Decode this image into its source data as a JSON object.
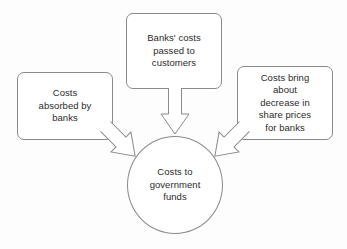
{
  "diagram": {
    "background_color": "#fdfdfd",
    "line_color": "#8a8a8a",
    "text_color": "#2b2b2b",
    "nodes": [
      {
        "id": "banks-costs-passed-to-customers",
        "shape": "rounded-rectangle",
        "text": "Banks' costs\npassed to\ncustomers"
      },
      {
        "id": "costs-absorbed-by-banks",
        "shape": "rounded-rectangle",
        "text": "Costs\nabsorbed by\nbanks"
      },
      {
        "id": "costs-bring-about-decrease",
        "shape": "rounded-rectangle",
        "text": "Costs bring\nabout\ndecrease in\nshare prices\nfor banks"
      },
      {
        "id": "costs-to-government-funds",
        "shape": "circle",
        "text": "Costs to\ngovernment\nfunds"
      }
    ],
    "arrows": [
      {
        "id": "arrow-top-to-circle",
        "from": "banks-costs-passed-to-customers",
        "to": "costs-to-government-funds",
        "direction": "down",
        "style": "hollow-block-arrow"
      },
      {
        "id": "arrow-left-to-circle",
        "from": "costs-absorbed-by-banks",
        "to": "costs-to-government-funds",
        "direction": "down-right",
        "style": "hollow-block-arrow"
      },
      {
        "id": "arrow-right-to-circle",
        "from": "costs-bring-about-decrease",
        "to": "costs-to-government-funds",
        "direction": "down-left",
        "style": "hollow-block-arrow"
      }
    ]
  }
}
